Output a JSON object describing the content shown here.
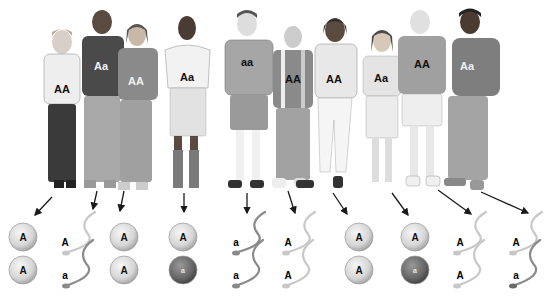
{
  "figure": {
    "people": [
      {
        "id": 1,
        "sex": "female",
        "genotype": "AA",
        "gametes_type": "egg",
        "gametes": [
          "A",
          "A"
        ]
      },
      {
        "id": 2,
        "sex": "male",
        "genotype": "Aa",
        "gametes_type": "sperm",
        "gametes": [
          "A",
          "a"
        ]
      },
      {
        "id": 3,
        "sex": "female",
        "genotype": "AA",
        "gametes_type": "egg",
        "gametes": [
          "A",
          "A"
        ]
      },
      {
        "id": 4,
        "sex": "female",
        "genotype": "Aa",
        "gametes_type": "egg",
        "gametes": [
          "A",
          "a"
        ]
      },
      {
        "id": 5,
        "sex": "male",
        "genotype": "aa",
        "gametes_type": "sperm",
        "gametes": [
          "a",
          "a"
        ]
      },
      {
        "id": 6,
        "sex": "male",
        "genotype": "AA",
        "gametes_type": "sperm",
        "gametes": [
          "A",
          "A"
        ]
      },
      {
        "id": 7,
        "sex": "female",
        "genotype": "AA",
        "gametes_type": "egg",
        "gametes": [
          "A",
          "A"
        ]
      },
      {
        "id": 8,
        "sex": "female",
        "genotype": "Aa",
        "gametes_type": "egg",
        "gametes": [
          "A",
          "a"
        ]
      },
      {
        "id": 9,
        "sex": "male",
        "genotype": "AA",
        "gametes_type": "sperm",
        "gametes": [
          "A",
          "A"
        ]
      },
      {
        "id": 10,
        "sex": "male",
        "genotype": "Aa",
        "gametes_type": "sperm",
        "gametes": [
          "A",
          "a"
        ]
      }
    ]
  },
  "colors": {
    "egg_dominant": "#d9d9d9",
    "egg_recessive": "#6e6e6e",
    "sperm_dominant": "#c8c8c8",
    "sperm_recessive": "#8a8a8a",
    "arrow": "#1a1a1a"
  }
}
